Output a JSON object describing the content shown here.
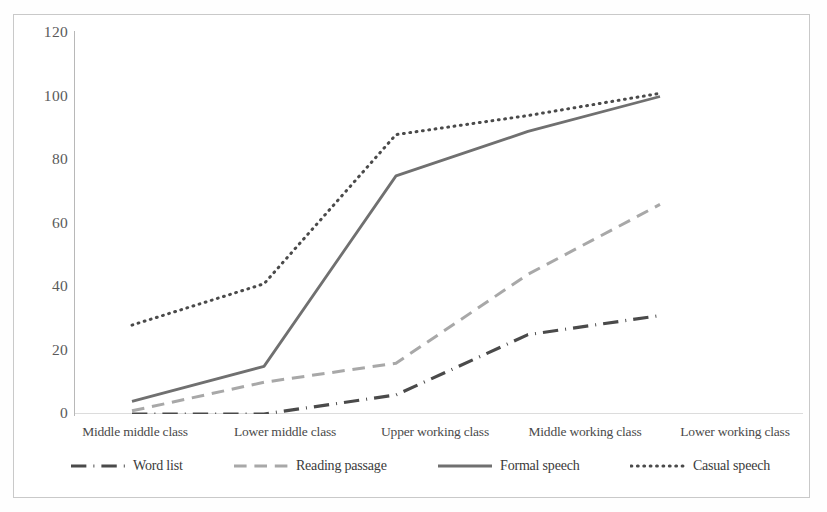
{
  "chart_data": {
    "type": "line",
    "title": "",
    "xlabel": "",
    "ylabel": "",
    "categories": [
      "Middle middle class",
      "Lower middle class",
      "Upper working class",
      "Middle working class",
      "Lower working class"
    ],
    "ylim": [
      0,
      120
    ],
    "yticks": [
      0,
      20,
      40,
      60,
      80,
      100,
      120
    ],
    "grid": false,
    "legend_position": "bottom",
    "series": [
      {
        "name": "Word list",
        "values": [
          0,
          0,
          6,
          25,
          31
        ],
        "style": "dash-dot",
        "color": "#4a4a4a",
        "width": 3.2
      },
      {
        "name": "Reading passage",
        "values": [
          1,
          10,
          16,
          44,
          66
        ],
        "style": "dashed",
        "color": "#a8a8a8",
        "width": 3.0
      },
      {
        "name": "Formal speech",
        "values": [
          4,
          15,
          75,
          89,
          100
        ],
        "style": "solid",
        "color": "#707070",
        "width": 2.8
      },
      {
        "name": "Casual speech",
        "values": [
          28,
          41,
          88,
          94,
          101
        ],
        "style": "dotted",
        "color": "#4a4a4a",
        "width": 3.0
      }
    ]
  },
  "axis": {
    "ytick_labels": [
      "120",
      "100",
      "80",
      "60",
      "40",
      "20",
      "0"
    ]
  },
  "legend": {
    "items": [
      {
        "label": "Word list",
        "swatch": "dash-dot-swatch"
      },
      {
        "label": "Reading passage",
        "swatch": "dashed-swatch"
      },
      {
        "label": "Formal speech",
        "swatch": "solid-swatch"
      },
      {
        "label": "Casual speech",
        "swatch": "dotted-swatch"
      }
    ]
  },
  "colors": {
    "frame": "#c9c9c9",
    "axis": "#b8b8b8",
    "tick_text": "#5a5a5a",
    "label_text": "#4a4a4a",
    "background": "#ffffff"
  }
}
